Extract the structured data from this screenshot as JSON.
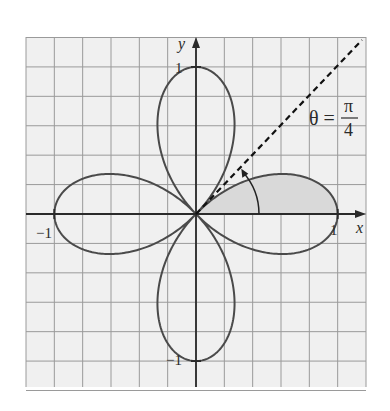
{
  "chart_data": {
    "type": "line",
    "subtype": "polar-curve",
    "title": "",
    "equation": "r = cos(2θ)",
    "curve_description": "Four-leaved rose",
    "xlabel": "x",
    "ylabel": "y",
    "xlim": [
      -1.2,
      1.2
    ],
    "ylim": [
      -1.2,
      1.2
    ],
    "grid": true,
    "grid_step": 0.2,
    "tick_labels": {
      "x": [
        {
          "value": -1,
          "label": "−1"
        },
        {
          "value": 1,
          "label": "1"
        }
      ],
      "y": [
        {
          "value": 1,
          "label": "1"
        },
        {
          "value": -1,
          "label": "−1"
        }
      ]
    },
    "shaded_region": {
      "description": "Region inside r = cos(2θ) for 0 ≤ θ ≤ π/4",
      "theta_start": 0,
      "theta_end": 0.7853981634,
      "fill": "#d9d9d9"
    },
    "annotations": [
      {
        "type": "dashed-line",
        "label_lhs": "θ =",
        "label_num": "π",
        "label_den": "4",
        "angle": "π/4"
      },
      {
        "type": "arc-arrow",
        "from_theta": 0,
        "to_theta": "π/4"
      }
    ],
    "colors": {
      "curve": "#4a4a4a",
      "axis": "#2a2a2a",
      "grid": "#9a9a9a",
      "background": "#f0f0f0",
      "shade": "#d9d9d9"
    }
  }
}
